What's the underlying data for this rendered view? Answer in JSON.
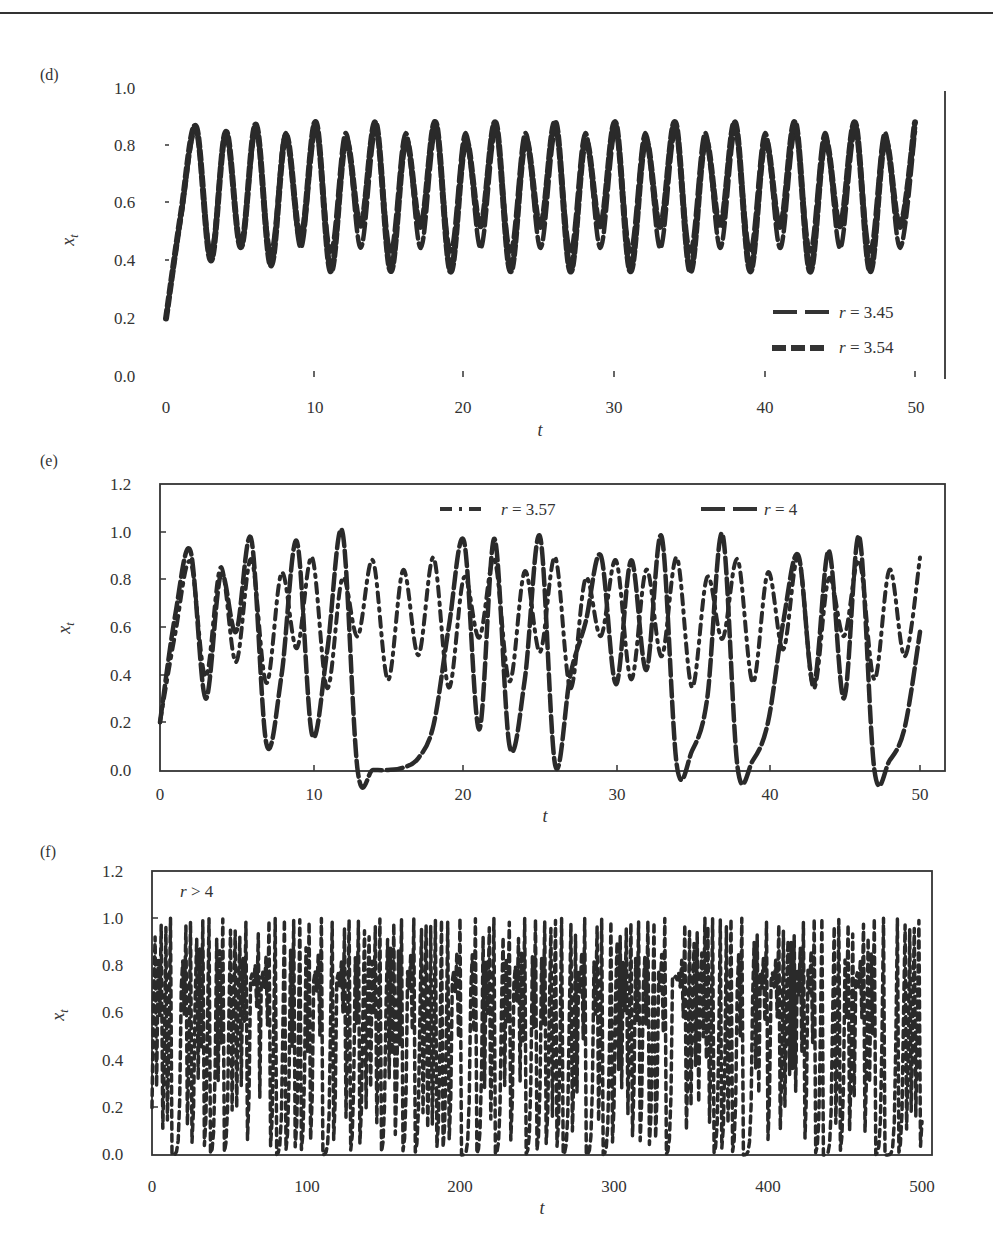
{
  "page": {
    "header_fragment": "... , Ecology, and Dynamics of Living Systems"
  },
  "chart_data": [
    {
      "panel": "(d)",
      "type": "line",
      "title": "",
      "xlabel": "t",
      "ylabel": "x_t",
      "xlim": [
        0,
        50
      ],
      "ylim": [
        0.0,
        1.0
      ],
      "xticks": [
        "0",
        "10",
        "20",
        "30",
        "40",
        "50"
      ],
      "yticks": [
        "0.0",
        "0.2",
        "0.4",
        "0.6",
        "0.8",
        "1.0"
      ],
      "grid": false,
      "legend_position": "lower right",
      "x": [
        0,
        1,
        2,
        3,
        4,
        5,
        6,
        7,
        8,
        9,
        10,
        11,
        12,
        13,
        14,
        15,
        16,
        17,
        18,
        19,
        20,
        21,
        22,
        23,
        24,
        25,
        26,
        27,
        28,
        29,
        30,
        31,
        32,
        33,
        34,
        35,
        36,
        37,
        38,
        39,
        40,
        41,
        42,
        43,
        44,
        45,
        46,
        47,
        48,
        49,
        50
      ],
      "series": [
        {
          "name": "r = 3.45",
          "style": "long-dash",
          "values": [
            0.2,
            0.552,
            0.853,
            0.432,
            0.847,
            0.448,
            0.853,
            0.432,
            0.847,
            0.447,
            0.853,
            0.433,
            0.847,
            0.447,
            0.853,
            0.434,
            0.847,
            0.446,
            0.852,
            0.434,
            0.847,
            0.446,
            0.852,
            0.434,
            0.847,
            0.446,
            0.852,
            0.434,
            0.847,
            0.446,
            0.852,
            0.434,
            0.847,
            0.446,
            0.852,
            0.434,
            0.847,
            0.446,
            0.852,
            0.434,
            0.847,
            0.446,
            0.852,
            0.434,
            0.847,
            0.446,
            0.852,
            0.434,
            0.847,
            0.446,
            0.852
          ]
        },
        {
          "name": "r = 3.54",
          "style": "short-dash",
          "values": [
            0.2,
            0.566,
            0.869,
            0.402,
            0.851,
            0.449,
            0.876,
            0.385,
            0.838,
            0.48,
            0.884,
            0.364,
            0.82,
            0.524,
            0.883,
            0.366,
            0.821,
            0.52,
            0.884,
            0.364,
            0.82,
            0.522,
            0.883,
            0.365,
            0.821,
            0.52,
            0.884,
            0.364,
            0.82,
            0.522,
            0.883,
            0.365,
            0.821,
            0.52,
            0.884,
            0.364,
            0.82,
            0.522,
            0.883,
            0.365,
            0.821,
            0.52,
            0.884,
            0.364,
            0.82,
            0.522,
            0.883,
            0.365,
            0.821,
            0.52,
            0.884
          ]
        }
      ]
    },
    {
      "panel": "(e)",
      "type": "line",
      "title": "",
      "xlabel": "t",
      "ylabel": "x_t",
      "xlim": [
        0,
        50
      ],
      "ylim": [
        0.0,
        1.2
      ],
      "xticks": [
        "0",
        "10",
        "20",
        "30",
        "40",
        "50"
      ],
      "yticks": [
        "0.0",
        "0.2",
        "0.4",
        "0.6",
        "0.8",
        "1.0",
        "1.2"
      ],
      "grid": false,
      "legend_position": "top",
      "x": [
        0,
        1,
        2,
        3,
        4,
        5,
        6,
        7,
        8,
        9,
        10,
        11,
        12,
        13,
        14,
        15,
        16,
        17,
        18,
        19,
        20,
        21,
        22,
        23,
        24,
        25,
        26,
        27,
        28,
        29,
        30,
        31,
        32,
        33,
        34,
        35,
        36,
        37,
        38,
        39,
        40,
        41,
        42,
        43,
        44,
        45,
        46,
        47,
        48,
        49,
        50
      ],
      "series": [
        {
          "name": "r = 3.57",
          "style": "dash-dot",
          "values": [
            0.2,
            0.571,
            0.874,
            0.392,
            0.851,
            0.453,
            0.885,
            0.365,
            0.827,
            0.511,
            0.892,
            0.344,
            0.805,
            0.56,
            0.88,
            0.378,
            0.839,
            0.482,
            0.891,
            0.346,
            0.808,
            0.555,
            0.882,
            0.372,
            0.834,
            0.495,
            0.892,
            0.343,
            0.804,
            0.562,
            0.879,
            0.38,
            0.841,
            0.477,
            0.891,
            0.348,
            0.81,
            0.55,
            0.884,
            0.367,
            0.829,
            0.506,
            0.892,
            0.343,
            0.804,
            0.562,
            0.879,
            0.38,
            0.841,
            0.477,
            0.891
          ]
        },
        {
          "name": "r = 4",
          "style": "long-dash",
          "values": [
            0.2,
            0.65,
            0.92,
            0.3,
            0.82,
            0.58,
            0.97,
            0.11,
            0.4,
            0.96,
            0.15,
            0.5,
            1.0,
            0.0,
            0.0,
            0.0,
            0.01,
            0.05,
            0.19,
            0.6,
            0.96,
            0.17,
            0.97,
            0.1,
            0.38,
            0.98,
            0.02,
            0.4,
            0.62,
            0.9,
            0.36,
            0.88,
            0.42,
            0.98,
            0.02,
            0.08,
            0.3,
            0.99,
            0.01,
            0.04,
            0.2,
            0.62,
            0.9,
            0.36,
            0.92,
            0.3,
            0.98,
            0.0,
            0.04,
            0.18,
            0.58
          ]
        }
      ]
    },
    {
      "panel": "(f)",
      "type": "line",
      "title": "",
      "xlabel": "t",
      "ylabel": "x_t",
      "xlim": [
        0,
        500
      ],
      "ylim": [
        0.0,
        1.2
      ],
      "xticks": [
        "0",
        "100",
        "200",
        "300",
        "400",
        "500"
      ],
      "yticks": [
        "0.0",
        "0.2",
        "0.4",
        "0.6",
        "0.8",
        "1.0",
        "1.2"
      ],
      "grid": false,
      "annotation": "r > 4",
      "series": [
        {
          "name": "r > 4",
          "style": "short-dash",
          "note": "chaotic trajectory oscillating densely between 0.0 and 1.0 for t = 0..500",
          "generator": {
            "map": "logistic",
            "r": 4.0,
            "x0": 0.2,
            "steps": 500
          }
        }
      ]
    }
  ],
  "panels": {
    "d": {
      "label": "(d)",
      "xlabel": "t",
      "ylabel": "x",
      "ylabel_sub": "t",
      "xticks": [
        "0",
        "10",
        "20",
        "30",
        "40",
        "50"
      ],
      "yticks": [
        "0.0",
        "0.2",
        "0.4",
        "0.6",
        "0.8",
        "1.0"
      ],
      "legend": [
        {
          "label": "r = 3.45"
        },
        {
          "label": "r = 3.54"
        }
      ]
    },
    "e": {
      "label": "(e)",
      "xlabel": "t",
      "ylabel": "x",
      "ylabel_sub": "t",
      "xticks": [
        "0",
        "10",
        "20",
        "30",
        "40",
        "50"
      ],
      "yticks": [
        "0.0",
        "0.2",
        "0.4",
        "0.6",
        "0.8",
        "1.0",
        "1.2"
      ],
      "legend": [
        {
          "label": "r = 3.57"
        },
        {
          "label": "r = 4"
        }
      ]
    },
    "f": {
      "label": "(f)",
      "xlabel": "t",
      "ylabel": "x",
      "ylabel_sub": "t",
      "annotation": "r > 4",
      "xticks": [
        "0",
        "100",
        "200",
        "300",
        "400",
        "500"
      ],
      "yticks": [
        "0.0",
        "0.2",
        "0.4",
        "0.6",
        "0.8",
        "1.0",
        "1.2"
      ]
    }
  },
  "colors": {
    "ink": "#2a2a2a",
    "background": "#ffffff"
  }
}
